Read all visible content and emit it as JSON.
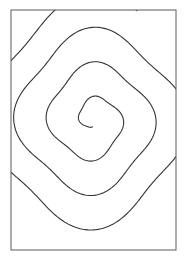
{
  "canvas": {
    "width": 187,
    "height": 261,
    "background_color": "#ffffff"
  },
  "artwork": {
    "title": "Spiral",
    "style": "line-art",
    "description": "Black outline spiral inside a rectangular border"
  },
  "frame": {
    "x": 11,
    "y": 10,
    "width": 165,
    "height": 240,
    "stroke_color": "#5a5a5a",
    "stroke_width": 1,
    "fill_color": "#ffffff"
  },
  "chart_data": {
    "type": "line",
    "xlabel": "",
    "ylabel": "",
    "curve": "archimedean-spiral",
    "center_x": 93,
    "center_y": 120,
    "start_radius": 6,
    "radius_growth_per_turn": 30,
    "turns": 3.55,
    "start_angle_deg": 95,
    "direction": "clockwise",
    "aspect_x": 1.0,
    "aspect_y": 1.06,
    "samples": 900,
    "stroke_color": "#333333",
    "stroke_width": 1.1,
    "clipped_to_frame": true,
    "crossings_left_at_y120": [
      22,
      51,
      79
    ],
    "crossings_right_at_y120": [
      117,
      145,
      170
    ],
    "crossings_top_at_x93": [
      42,
      74,
      104
    ],
    "crossings_bottom_at_x93": [
      148,
      185,
      214
    ],
    "inner_terminus": [
      87,
      122
    ]
  }
}
